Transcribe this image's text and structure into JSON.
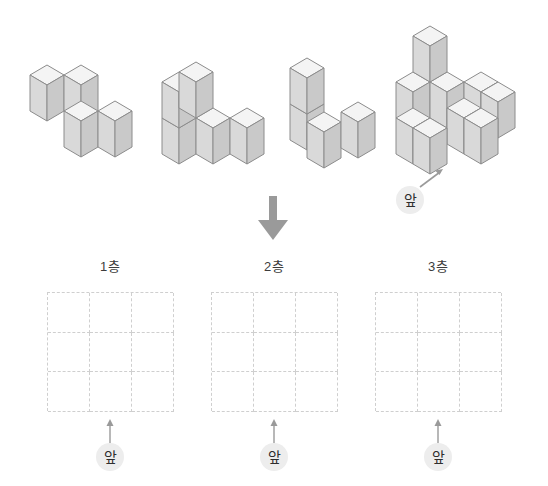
{
  "page": {
    "background": "#ffffff"
  },
  "colors": {
    "cube_top": "#f2f2f2",
    "cube_front": "#d6d6d6",
    "cube_side": "#c6c6c6",
    "cube_stroke": "#8c8c8c",
    "grid_line": "#cfcfcf",
    "arrow": "#9a9a9a",
    "badge_bg": "#ededed",
    "text": "#2e2e2e"
  },
  "solids": {
    "count": 4,
    "description": "네 개의 쌓기나무 입체 도형",
    "items": [
      {
        "name": "solid-1",
        "cube_count": 4
      },
      {
        "name": "solid-2",
        "cube_count": 5
      },
      {
        "name": "solid-3",
        "cube_count": 4
      },
      {
        "name": "solid-4",
        "cube_count": 9
      }
    ],
    "front_marker": {
      "label": "앞",
      "arrow": "diagonal-up-right"
    }
  },
  "flow": {
    "arrow": "down-arrow"
  },
  "grids": {
    "rows": 3,
    "cols": 3,
    "line_style": "dashed",
    "items": [
      {
        "label": "1층",
        "name": "grid-floor-1",
        "front": "앞"
      },
      {
        "label": "2층",
        "name": "grid-floor-2",
        "front": "앞"
      },
      {
        "label": "3층",
        "name": "grid-floor-3",
        "front": "앞"
      }
    ]
  }
}
